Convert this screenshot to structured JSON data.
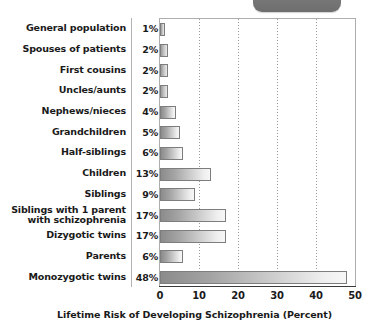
{
  "top_tab": {
    "name": "rounded-tab-partial"
  },
  "chart_data": {
    "type": "bar",
    "orientation": "horizontal",
    "title": "",
    "xlabel": "Lifetime Risk of Developing Schizophrenia (Percent)",
    "ylabel": "",
    "xlim": [
      0,
      50
    ],
    "xticks": [
      0,
      10,
      20,
      30,
      40,
      50
    ],
    "xtick_labels": [
      "0",
      "10",
      "20",
      "30",
      "40",
      "50"
    ],
    "grid": "vertical-dotted",
    "legend": "none",
    "categories": [
      "General population",
      "Spouses of patients",
      "First cousins",
      "Uncles/aunts",
      "Nephews/nieces",
      "Grandchildren",
      "Half-siblings",
      "Children",
      "Siblings",
      "Siblings with 1 parent\nwith schizophrenia",
      "Dizygotic twins",
      "Parents",
      "Monozygotic twins"
    ],
    "values": [
      1,
      2,
      2,
      2,
      4,
      5,
      6,
      13,
      9,
      17,
      17,
      6,
      48
    ],
    "value_labels": [
      "1%",
      "2%",
      "2%",
      "2%",
      "4%",
      "5%",
      "6%",
      "13%",
      "9%",
      "17%",
      "17%",
      "6%",
      "48%"
    ]
  },
  "style": {
    "bar_fill_dark": "#8b8b8b",
    "bar_fill_light": "#f7f7f7",
    "bar_border": "#7d7d7d",
    "gridline_color": "#9a9a9a",
    "axis_color": "#3a3a3a",
    "plot_border": "#adadad",
    "divider_color": "#b4b4b4",
    "text_color": "#1a1a1a",
    "tab_color": "#767676"
  }
}
